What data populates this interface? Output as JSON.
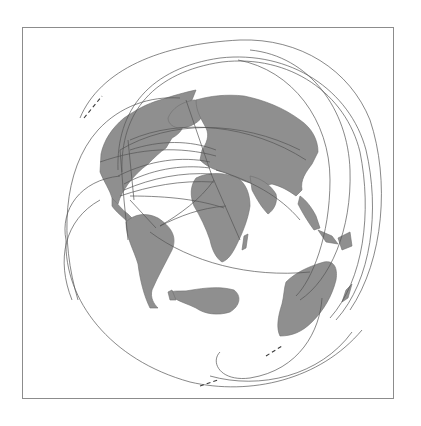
{
  "map": {
    "projection": "azimuthal / orthographic globe view",
    "background_color": "#ffffff",
    "frame_color": "#8c8c8c",
    "land_color": "#8f8f8f",
    "land_stroke": "#6e6e6e",
    "route_color": "#555555",
    "frame": {
      "x": 22,
      "y": 27,
      "width": 372,
      "height": 372
    },
    "landmasses": [
      {
        "name": "north-america",
        "d": "M101,154 C104,140 112,128 124,118 C136,110 146,104 160,100 C172,96 186,92 196,90 L192,100 C184,104 178,112 172,118 L182,120 C186,126 180,134 172,138 L166,148 C160,152 154,158 148,164 C140,170 134,176 128,184 C124,190 120,196 118,204 L112,198 C110,190 104,182 100,172 Z"
      },
      {
        "name": "greenland",
        "d": "M168,118 C172,108 182,102 194,100 C202,100 206,106 204,114 C200,122 190,128 180,128 C174,128 168,124 168,118 Z"
      },
      {
        "name": "central-america",
        "d": "M112,198 C118,204 122,210 128,214 L134,220 L130,224 C124,218 116,212 112,206 Z"
      },
      {
        "name": "south-america",
        "d": "M126,222 C134,214 146,212 158,218 C170,226 178,236 172,250 C166,262 158,276 152,290 C150,298 154,304 158,308 L150,308 C144,296 140,280 138,264 C134,250 126,238 126,222 Z"
      },
      {
        "name": "europe-asia",
        "d": "M196,100 C210,96 226,94 244,96 C264,100 284,108 300,120 C312,128 318,140 318,152 L312,164 C306,172 300,180 302,190 L296,196 C288,190 280,186 272,184 L262,186 C252,184 240,180 232,176 L224,172 C214,170 206,166 200,160 L202,150 C206,144 210,136 206,128 C202,120 196,112 196,100 Z"
      },
      {
        "name": "africa",
        "d": "M196,178 C208,172 224,172 238,178 C246,184 250,194 250,206 C248,220 242,234 236,246 C232,254 228,260 222,262 C216,258 212,250 210,240 C206,228 200,216 194,206 C190,196 190,186 196,178 Z"
      },
      {
        "name": "madagascar",
        "d": "M244,236 L248,234 L246,248 L242,250 Z"
      },
      {
        "name": "arabia-india",
        "d": "M250,176 C260,178 270,184 276,194 C278,202 274,210 268,214 C262,208 256,198 252,190 Z"
      },
      {
        "name": "southeast-asia",
        "d": "M300,196 C306,200 312,208 316,216 L320,228 L314,230 C308,222 302,212 298,204 Z"
      },
      {
        "name": "indonesia",
        "d": "M318,230 L332,236 L338,244 L326,242 Z M338,238 L350,232 L352,246 L342,250 Z"
      },
      {
        "name": "australia",
        "d": "M286,282 C296,272 310,266 324,262 C334,260 338,268 336,280 C332,296 324,310 312,322 C302,332 292,336 280,336 C276,328 278,316 282,304 C284,296 284,288 286,282 Z"
      },
      {
        "name": "new-zealand",
        "d": "M346,290 L352,284 L348,298 L342,302 Z"
      },
      {
        "name": "antarctica",
        "d": "M170,292 C176,290 184,292 192,290 C204,288 220,286 234,290 C242,296 240,306 230,312 C218,316 204,314 196,308 C188,304 180,302 174,298 Z"
      },
      {
        "name": "antarctic-peninsula",
        "d": "M168,292 L172,290 L176,300 L170,300 Z"
      }
    ],
    "routes": [
      {
        "name": "outer-arc-west",
        "d": "M78,300 C60,240 62,170 98,130 C120,106 150,96 180,98"
      },
      {
        "name": "outer-arc-northwest",
        "d": "M80,118 C100,70 160,44 240,40 C300,38 350,70 370,120 C390,180 384,260 350,310"
      },
      {
        "name": "outer-arc-north-1",
        "d": "M118,170 C116,110 150,68 220,58 C290,50 350,90 366,150 C380,210 372,280 336,320"
      },
      {
        "name": "outer-arc-north-2",
        "d": "M122,172 C120,112 154,72 222,62 C290,54 346,94 360,152 C372,212 364,280 330,318"
      },
      {
        "name": "outer-arc-east",
        "d": "M250,50 C310,56 348,110 350,170 C352,230 330,280 300,300"
      },
      {
        "name": "inner-arc-east",
        "d": "M238,60 C292,70 330,120 330,180 C330,236 312,280 296,296"
      },
      {
        "name": "south-loop",
        "d": "M66,240 C64,300 110,360 190,382 C250,396 320,380 362,330"
      },
      {
        "name": "south-loop-2",
        "d": "M210,376 C260,390 320,376 352,332"
      },
      {
        "name": "australia-loop",
        "d": "M322,298 C320,330 300,370 250,378 C220,382 210,362 220,352"
      },
      {
        "name": "transatlantic-1",
        "d": "M124,184 C150,170 180,164 210,168"
      },
      {
        "name": "transatlantic-2",
        "d": "M124,190 C152,178 182,172 212,174"
      },
      {
        "name": "transatlantic-3",
        "d": "M120,196 C150,186 180,180 214,182"
      },
      {
        "name": "transatlantic-4",
        "d": "M118,176 C150,160 182,156 210,162"
      },
      {
        "name": "na-eu-1",
        "d": "M130,150 C160,140 190,140 216,150"
      },
      {
        "name": "na-eu-2",
        "d": "M100,162 C140,148 180,146 216,156"
      },
      {
        "name": "na-asia-1",
        "d": "M120,150 C170,120 240,120 300,150"
      },
      {
        "name": "na-asia-2",
        "d": "M130,140 C180,118 250,124 306,160"
      },
      {
        "name": "eu-sa",
        "d": "M214,180 C200,200 180,214 160,226"
      },
      {
        "name": "africa-sa",
        "d": "M160,226 C180,216 200,208 226,206"
      },
      {
        "name": "sa-australia",
        "d": "M150,232 C190,262 250,278 310,272"
      },
      {
        "name": "na-sa-1",
        "d": "M124,200 L128,240"
      },
      {
        "name": "na-sa-2",
        "d": "M130,200 L156,228"
      },
      {
        "name": "na-north-1",
        "d": "M120,150 L124,200"
      },
      {
        "name": "na-north-2",
        "d": "M128,140 L134,200"
      },
      {
        "name": "eu-north",
        "d": "M186,100 L212,176"
      },
      {
        "name": "eu-africa",
        "d": "M212,176 L240,240"
      },
      {
        "name": "eu-asia",
        "d": "M216,170 C250,180 280,196 300,220"
      },
      {
        "name": "na-africa",
        "d": "M130,196 C170,196 200,200 224,208"
      },
      {
        "name": "pacific-west",
        "d": "M66,240 C60,210 80,180 120,176"
      },
      {
        "name": "pacific-west-2",
        "d": "M72,300 C56,260 64,220 100,200"
      }
    ],
    "dashed_marks": [
      {
        "name": "north-dash",
        "d": "M84,118 L102,96"
      },
      {
        "name": "south-dash-1",
        "d": "M200,386 L218,380"
      },
      {
        "name": "south-dash-2",
        "d": "M266,356 L282,346"
      }
    ]
  }
}
